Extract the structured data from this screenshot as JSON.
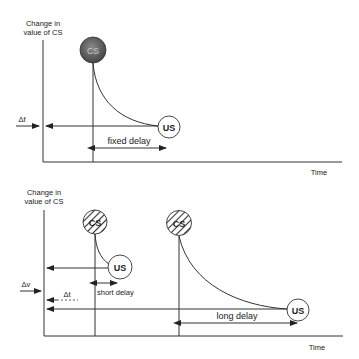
{
  "top_panel": {
    "y_axis_label_line1": "Change in",
    "y_axis_label_line2": "value of CS",
    "x_axis_label": "Time",
    "cs_label": "CS",
    "us_label": "US",
    "delta_label": "Δf",
    "delay_label": "fixed delay",
    "cs_style": "filled"
  },
  "bottom_panel": {
    "y_axis_label_line1": "Change in",
    "y_axis_label_line2": "value of CS",
    "x_axis_label": "Time",
    "cs_label_1": "CS",
    "cs_label_2": "CS",
    "us_label_short": "US",
    "us_label_long": "US",
    "delta_v_label": "Δv",
    "delta_t_label": "Δt",
    "short_delay_label": "short delay",
    "long_delay_label": "long delay",
    "cs_style": "hatched"
  },
  "colors": {
    "line": "#333333",
    "cs_fill_dark": "#555555",
    "text": "#222222"
  }
}
